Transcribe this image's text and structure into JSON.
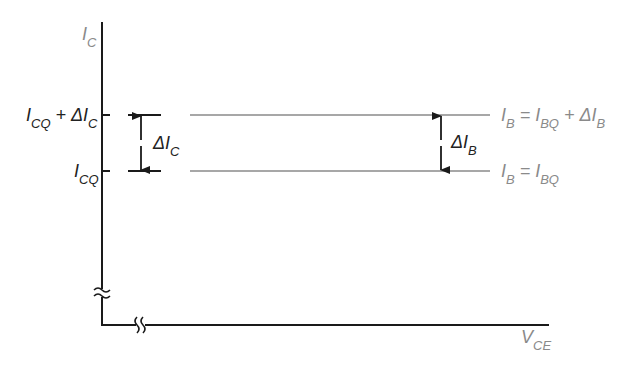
{
  "diagram": {
    "title": "",
    "y_axis_label": {
      "main": "I",
      "sub": "C"
    },
    "x_axis_label": {
      "main": "V",
      "sub": "CE"
    },
    "left_labels": [
      {
        "parts": [
          {
            "t": "I",
            "s": ""
          },
          {
            "t": "",
            "s": "CQ"
          },
          {
            "t": " + ΔI",
            "s": ""
          },
          {
            "t": "",
            "s": "C"
          }
        ]
      },
      {
        "parts": [
          {
            "t": "I",
            "s": ""
          },
          {
            "t": "",
            "s": "CQ"
          }
        ]
      }
    ],
    "delta_ic": {
      "main": "ΔI",
      "sub": "C"
    },
    "delta_ib": {
      "main": "ΔI",
      "sub": "B"
    },
    "curves": [
      {
        "name": "upper",
        "parts": [
          {
            "t": "I",
            "s": ""
          },
          {
            "t": "",
            "s": "B"
          },
          {
            "t": " = I",
            "s": ""
          },
          {
            "t": "",
            "s": "BQ"
          },
          {
            "t": " + ΔI",
            "s": ""
          },
          {
            "t": "",
            "s": "B"
          }
        ]
      },
      {
        "name": "lower",
        "parts": [
          {
            "t": "I",
            "s": ""
          },
          {
            "t": "",
            "s": "B"
          },
          {
            "t": " = I",
            "s": ""
          },
          {
            "t": "",
            "s": "BQ"
          }
        ]
      }
    ],
    "colors": {
      "axis": "#1a1a1a",
      "curve": "#8a8a8a",
      "label_dark": "#222222",
      "label_gray": "#8a8a8a"
    }
  }
}
